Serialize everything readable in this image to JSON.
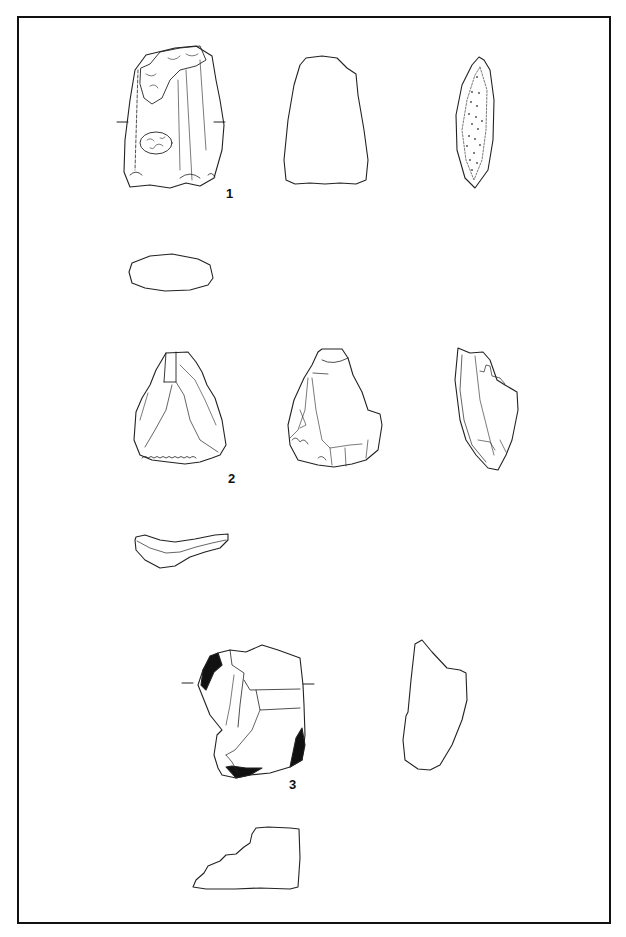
{
  "plate": {
    "figures": [
      {
        "label": "1",
        "views": [
          "dorsal",
          "profile-outline",
          "lateral-section",
          "cross-section"
        ]
      },
      {
        "label": "2",
        "views": [
          "dorsal",
          "ventral",
          "lateral",
          "cross-section"
        ]
      },
      {
        "label": "3",
        "views": [
          "dorsal",
          "lateral-outline",
          "cross-section"
        ]
      }
    ]
  },
  "caption": ""
}
